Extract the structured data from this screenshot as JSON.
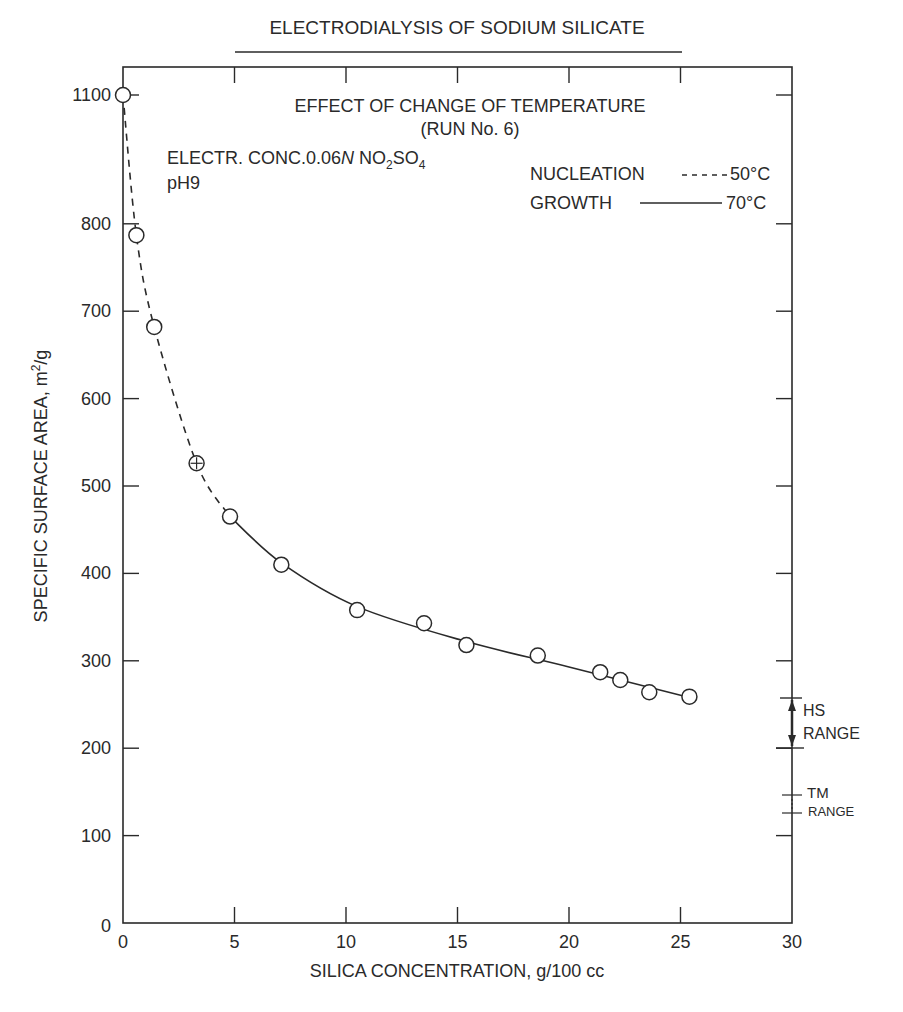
{
  "title": "ELECTRODIALYSIS OF SODIUM SILICATE",
  "subtitle": "EFFECT OF CHANGE OF TEMPERATURE",
  "run": "(RUN No. 6)",
  "conditions": {
    "electrolyte_prefix": "ELECTR. CONC.0.06",
    "normality": "N",
    "formula_no": "NO",
    "sub2": "2",
    "formula_so": "SO",
    "sub4": "4",
    "ph": "pH9"
  },
  "legend": [
    {
      "label": "NUCLEATION",
      "style": "dashed",
      "temp": "50°C"
    },
    {
      "label": "GROWTH",
      "style": "solid",
      "temp": "70°C"
    }
  ],
  "axes": {
    "xlabel": "SILICA CONCENTRATION, g/100 cc",
    "ylabel_main": "SPECIFIC SURFACE AREA, m",
    "ylabel_sup": "2",
    "ylabel_tail": "/g",
    "xticks": [
      "0",
      "5",
      "10",
      "15",
      "20",
      "25",
      "30"
    ],
    "yticks": [
      "0",
      "100",
      "200",
      "300",
      "400",
      "500",
      "600",
      "700",
      "800",
      "1100"
    ]
  },
  "ranges": {
    "hs_line1": "HS",
    "hs_line2": "RANGE",
    "tm_line1": "TM",
    "tm_line2": "RANGE"
  },
  "chart_data": {
    "type": "scatter",
    "title": "ELECTRODIALYSIS OF SODIUM SILICATE",
    "subtitle": "EFFECT OF CHANGE OF TEMPERATURE (RUN No. 6)",
    "xlabel": "SILICA CONCENTRATION, g/100 cc",
    "ylabel": "SPECIFIC SURFACE AREA, m2/g",
    "xlim": [
      0,
      30
    ],
    "ylim": [
      0,
      1100
    ],
    "y_axis_break": "between 800 and 1100",
    "grid": false,
    "annotations": [
      "ELECTR. CONC.0.06N NO2SO4",
      "pH9",
      "HS RANGE 200-260",
      "TM RANGE 130-150"
    ],
    "series": [
      {
        "name": "NUCLEATION 50°C (dashed)",
        "x": [
          0.0,
          0.6,
          1.4,
          3.3,
          4.8
        ],
        "y": [
          1100,
          787,
          682,
          526,
          465
        ]
      },
      {
        "name": "GROWTH 70°C (solid)",
        "x": [
          4.8,
          7.1,
          10.5,
          13.5,
          15.4,
          18.6,
          21.4,
          22.3,
          23.6,
          25.4
        ],
        "y": [
          465,
          410,
          358,
          343,
          318,
          306,
          287,
          278,
          264,
          259
        ]
      }
    ],
    "ranges": [
      {
        "name": "HS RANGE",
        "ymin": 200,
        "ymax": 260
      },
      {
        "name": "TM RANGE",
        "ymin": 130,
        "ymax": 150
      }
    ]
  }
}
